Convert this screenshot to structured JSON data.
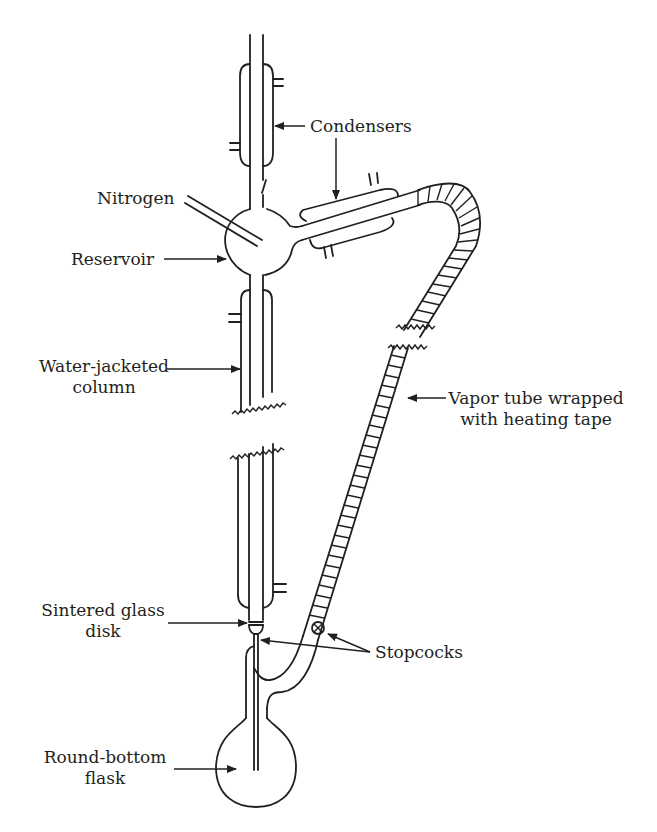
{
  "diagram": {
    "labels": {
      "condensers": "Condensers",
      "nitrogen": "Nitrogen",
      "reservoir": "Reservoir",
      "water_jacketed_line1": "Water-jacketed",
      "water_jacketed_line2": "column",
      "vapor_tube_line1": "Vapor tube wrapped",
      "vapor_tube_line2": "with heating tape",
      "sintered_line1": "Sintered glass",
      "sintered_line2": "disk",
      "stopcocks": "Stopcocks",
      "flask_line1": "Round-bottom",
      "flask_line2": "flask"
    },
    "components": [
      {
        "id": "top-condenser",
        "type": "condenser"
      },
      {
        "id": "side-condenser",
        "type": "condenser"
      },
      {
        "id": "nitrogen-inlet",
        "type": "tube"
      },
      {
        "id": "reservoir",
        "type": "bulb"
      },
      {
        "id": "water-jacketed-column",
        "type": "column",
        "broken": true
      },
      {
        "id": "vapor-tube",
        "type": "heated-tube",
        "broken": true
      },
      {
        "id": "sintered-glass-disk",
        "type": "frit"
      },
      {
        "id": "stopcock",
        "type": "valve"
      },
      {
        "id": "round-bottom-flask",
        "type": "flask"
      }
    ],
    "colors": {
      "ink": "#231f20",
      "background": "#ffffff"
    }
  }
}
